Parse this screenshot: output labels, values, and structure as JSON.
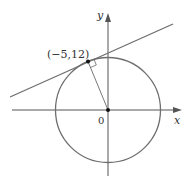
{
  "diagram": {
    "colors": {
      "stroke": "#6e6e6e",
      "axis": "#555555",
      "text": "#333333",
      "point": "#111111"
    },
    "labels": {
      "point": "(−5,12)",
      "origin": "0",
      "x_axis": "x",
      "y_axis": "y"
    },
    "circle": {
      "center": [
        0,
        0
      ],
      "radius": 13
    },
    "tangent_point": [
      -5,
      12
    ]
  }
}
